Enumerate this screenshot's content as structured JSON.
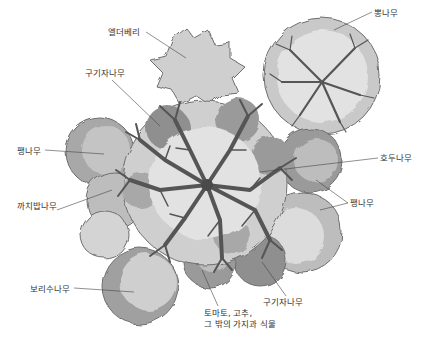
{
  "diagram": {
    "type": "plant-guild-illustration",
    "colors": {
      "background": "#ffffff",
      "canopy_dark": "#8a8a8a",
      "canopy_mid": "#a8a8a8",
      "canopy_light": "#cfcfcf",
      "canopy_pale": "#e4e4e4",
      "branch": "#555555",
      "leader_line": "#444444",
      "label_text": "#333333"
    },
    "labels": [
      {
        "id": "elderberry",
        "text": "엘더베리",
        "x": 108,
        "y": 27
      },
      {
        "id": "mulberry",
        "text": "뽕나무",
        "x": 374,
        "y": 8
      },
      {
        "id": "goji-top",
        "text": "구기자나무",
        "x": 85,
        "y": 68
      },
      {
        "id": "pea-left",
        "text": "팽나무",
        "x": 17,
        "y": 146
      },
      {
        "id": "walnut",
        "text": "호두나무",
        "x": 380,
        "y": 153
      },
      {
        "id": "pea-right",
        "text": "팽나무",
        "x": 350,
        "y": 198
      },
      {
        "id": "sea-buckthorn",
        "text": "까치밥나무",
        "x": 17,
        "y": 201
      },
      {
        "id": "silverberry",
        "text": "보리수나무",
        "x": 30,
        "y": 284
      },
      {
        "id": "goji-bottom",
        "text": "구기자나무",
        "x": 263,
        "y": 297
      },
      {
        "id": "nightshades",
        "text": "토마토, 고추,\n그 밖의 가지과 식물",
        "x": 204,
        "y": 308
      }
    ]
  }
}
